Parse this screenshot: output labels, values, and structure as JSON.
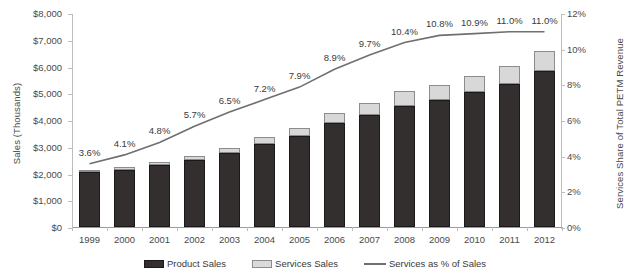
{
  "chart_data": {
    "type": "bar",
    "title": "",
    "subtitle": "",
    "xlabel": "",
    "ylabel": "Sales (Thousands)",
    "y2label": "Services Share of Total PETM Revenue",
    "categories": [
      "1999",
      "2000",
      "2001",
      "2002",
      "2003",
      "2004",
      "2005",
      "2006",
      "2007",
      "2008",
      "2009",
      "2010",
      "2011",
      "2012"
    ],
    "ylim": [
      0,
      8000
    ],
    "y2lim": [
      0,
      12
    ],
    "grid": false,
    "legend_position": "bottom",
    "y_ticks": [
      "$0",
      "$1,000",
      "$2,000",
      "$3,000",
      "$4,000",
      "$5,000",
      "$6,000",
      "$7,000",
      "$8,000"
    ],
    "y_tick_values": [
      0,
      1000,
      2000,
      3000,
      4000,
      5000,
      6000,
      7000,
      8000
    ],
    "y2_ticks": [
      "0%",
      "2%",
      "4%",
      "6%",
      "8%",
      "10%",
      "12%"
    ],
    "y2_tick_values": [
      0,
      2,
      4,
      6,
      8,
      10,
      12
    ],
    "series": [
      {
        "name": "Product Sales",
        "type": "bar",
        "color": "#332f2f",
        "values": [
          2055,
          2135,
          2325,
          2490,
          2760,
          3110,
          3405,
          3875,
          4195,
          4540,
          4740,
          5040,
          5355,
          5840
        ]
      },
      {
        "name": "Services Sales",
        "type": "bar",
        "color": "#d8d8d8",
        "values": [
          77,
          91,
          117,
          150,
          192,
          241,
          292,
          379,
          451,
          527,
          574,
          617,
          662,
          722
        ]
      },
      {
        "name": "Services as % of Sales",
        "type": "line",
        "axis": "right",
        "color": "#6f6f6f",
        "values": [
          3.6,
          4.1,
          4.8,
          5.7,
          6.5,
          7.2,
          7.9,
          8.9,
          9.7,
          10.4,
          10.8,
          10.9,
          11.0,
          11.0
        ],
        "labels": [
          "3.6%",
          "4.1%",
          "4.8%",
          "5.7%",
          "6.5%",
          "7.2%",
          "7.9%",
          "8.9%",
          "9.7%",
          "10.4%",
          "10.8%",
          "10.9%",
          "11.0%",
          "11.0%"
        ]
      }
    ],
    "totals": [
      2132,
      2226,
      2442,
      2640,
      2952,
      3351,
      3697,
      4254,
      4646,
      5067,
      5314,
      5657,
      6017,
      6562
    ]
  },
  "legend": {
    "items": [
      {
        "label": "Product Sales",
        "swatch": "product-swatch"
      },
      {
        "label": "Services Sales",
        "swatch": "services-swatch"
      },
      {
        "label": "Services as % of Sales",
        "swatch": "line-swatch"
      }
    ]
  }
}
